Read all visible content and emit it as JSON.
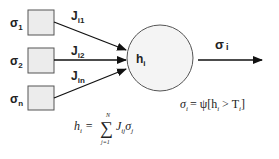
{
  "diagram": {
    "type": "neuron-model",
    "inputs": [
      {
        "label": "σ",
        "sub": "1",
        "weight": "J",
        "weight_sub": "i1"
      },
      {
        "label": "σ",
        "sub": "2",
        "weight": "J",
        "weight_sub": "i2"
      },
      {
        "label": "σ",
        "sub": "n",
        "weight": "J",
        "weight_sub": "in"
      }
    ],
    "neuron": {
      "label": "h",
      "sub": "i"
    },
    "output": {
      "label": "σ",
      "sub": "i"
    },
    "equations": {
      "activation": {
        "lhs": "σ",
        "lhs_sub": "i",
        "rhs": "= ψ[h",
        "rhs_sub": "i",
        "rhs2": " > T",
        "rhs2_sub": "i",
        "close": "]"
      },
      "sum": {
        "lhs": "h",
        "lhs_sub": "i",
        "eq": "=",
        "sigma": "∑",
        "upper": "N",
        "lower": "j=1",
        "term": "J",
        "term_sub": "ij",
        "term2": "σ",
        "term2_sub": "j"
      }
    },
    "colors": {
      "box_fill": "#ececec",
      "stroke": "#555555",
      "text": "#222222"
    }
  }
}
